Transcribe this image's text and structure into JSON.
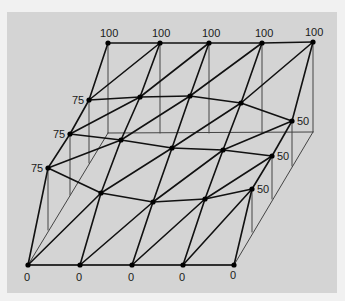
{
  "diagram": {
    "type": "3d-triangulated-surface-mesh",
    "colors": {
      "background": "#f1f1f1",
      "panel": "#d4d4d4",
      "edge": "#111111",
      "guide": "#444444",
      "node": "#000000"
    },
    "grid": {
      "rows": [
        [
          [
            108,
            43
          ],
          [
            160,
            43
          ],
          [
            209,
            43
          ],
          [
            262,
            43
          ],
          [
            313,
            42
          ]
        ],
        [
          [
            89,
            100
          ],
          [
            140,
            97
          ],
          [
            190,
            96
          ],
          [
            241,
            103
          ],
          [
            292,
            121
          ]
        ],
        [
          [
            70,
            134
          ],
          [
            121,
            140
          ],
          [
            172,
            148
          ],
          [
            223,
            150
          ],
          [
            272,
            156
          ]
        ],
        [
          [
            48,
            168
          ],
          [
            101,
            193
          ],
          [
            153,
            202
          ],
          [
            205,
            199
          ],
          [
            252,
            189
          ]
        ],
        [
          [
            28,
            265
          ],
          [
            80,
            265
          ],
          [
            132,
            265
          ],
          [
            183,
            265
          ],
          [
            234,
            265
          ]
        ]
      ]
    },
    "base_plane": [
      [
        108,
        133
      ],
      [
        313,
        132
      ],
      [
        234,
        265
      ],
      [
        28,
        265
      ]
    ],
    "drop_lines": [
      [
        [
          108,
          43
        ],
        [
          108,
          133
        ]
      ],
      [
        [
          160,
          43
        ],
        [
          160,
          133
        ]
      ],
      [
        [
          209,
          43
        ],
        [
          209,
          133
        ]
      ],
      [
        [
          262,
          43
        ],
        [
          262,
          133
        ]
      ],
      [
        [
          313,
          42
        ],
        [
          313,
          132
        ]
      ],
      [
        [
          89,
          100
        ],
        [
          89,
          163
        ]
      ],
      [
        [
          70,
          134
        ],
        [
          70,
          195
        ]
      ],
      [
        [
          48,
          168
        ],
        [
          48,
          230
        ]
      ],
      [
        [
          292,
          121
        ],
        [
          292,
          166
        ]
      ],
      [
        [
          272,
          156
        ],
        [
          272,
          199
        ]
      ],
      [
        [
          252,
          189
        ],
        [
          252,
          232
        ]
      ]
    ],
    "labels": [
      {
        "text": "100",
        "x": 100,
        "y": 37
      },
      {
        "text": "100",
        "x": 152,
        "y": 37
      },
      {
        "text": "100",
        "x": 202,
        "y": 37
      },
      {
        "text": "100",
        "x": 255,
        "y": 37
      },
      {
        "text": "100",
        "x": 305,
        "y": 36
      },
      {
        "text": "75",
        "x": 72,
        "y": 104
      },
      {
        "text": "75",
        "x": 53,
        "y": 138
      },
      {
        "text": "75",
        "x": 31,
        "y": 172
      },
      {
        "text": "50",
        "x": 297,
        "y": 125
      },
      {
        "text": "50",
        "x": 277,
        "y": 160
      },
      {
        "text": "50",
        "x": 257,
        "y": 193
      },
      {
        "text": "0",
        "x": 24,
        "y": 281
      },
      {
        "text": "0",
        "x": 76,
        "y": 281
      },
      {
        "text": "0",
        "x": 128,
        "y": 281
      },
      {
        "text": "0",
        "x": 179,
        "y": 281
      },
      {
        "text": "0",
        "x": 230,
        "y": 279
      }
    ]
  }
}
